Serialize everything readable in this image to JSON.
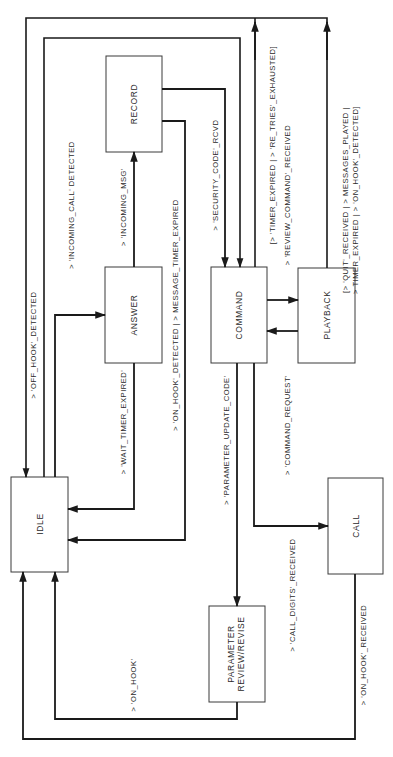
{
  "diagram": {
    "type": "state-transition-diagram",
    "orientation": "rotated-90-ccw",
    "states": [
      {
        "id": "idle",
        "label": "IDLE"
      },
      {
        "id": "answer",
        "label": "ANSWER"
      },
      {
        "id": "record",
        "label": "RECORD"
      },
      {
        "id": "command",
        "label": "COMMAND"
      },
      {
        "id": "playback",
        "label": "PLAYBACK"
      },
      {
        "id": "call",
        "label": "CALL"
      },
      {
        "id": "param",
        "label_line1": "PARAMETER",
        "label_line2": "REVIEW/REVISE"
      }
    ],
    "transitions": [
      {
        "id": "t1",
        "from": "IDLE",
        "to": "ANSWER",
        "label": "> 'INCOMING_CALL' DETECTED"
      },
      {
        "id": "t2",
        "from": "ANSWER",
        "to": "IDLE",
        "label": "> 'WAIT_TIMER_EXPIRED'"
      },
      {
        "id": "t3",
        "from": "ANSWER",
        "to": "RECORD",
        "label": "> 'INCOMING_MSG'"
      },
      {
        "id": "t4",
        "from": "RECORD",
        "to": "IDLE",
        "label": "> 'ON_HOOK'_DETECTED | > MESSAGE_TIMER_EXPIRED"
      },
      {
        "id": "t5",
        "from": "IDLE",
        "to": "COMMAND",
        "label": "> 'OFF_HOOK'_DETECTED"
      },
      {
        "id": "t6",
        "from": "RECORD",
        "to": "COMMAND",
        "label": "> 'SECURITY_CODE'_RCVD"
      },
      {
        "id": "t7",
        "from": "COMMAND",
        "to": "IDLE",
        "label": "[> 'TIMER_EXPIRED | > 'RE_TRIES'_EXHAUSTED]"
      },
      {
        "id": "t8",
        "from": "COMMAND",
        "to": "PLAYBACK",
        "label": "> 'REVIEW_COMMAND'_RECEIVED"
      },
      {
        "id": "t9",
        "from": "PLAYBACK",
        "to": "COMMAND",
        "label": "> 'COMMAND_REQUEST'"
      },
      {
        "id": "t10",
        "from": "PLAYBACK",
        "to": "IDLE",
        "label_line1": "[> 'QUIT'_RECEIVED | > MESSAGES_PLAYED |",
        "label_line2": "> TIMER_EXPIRED | > 'ON_HOOK'_DETECTED]"
      },
      {
        "id": "t11",
        "from": "COMMAND",
        "to": "PARAMETER REVIEW/REVISE",
        "label": "> 'PARAMETER_UPDATE_CODE'"
      },
      {
        "id": "t12",
        "from": "COMMAND",
        "to": "CALL",
        "label": "> 'CALL_DIGITS'_RECEIVED"
      },
      {
        "id": "t13",
        "from": "PARAMETER REVIEW/REVISE",
        "to": "IDLE",
        "label": "> 'ON_HOOK'"
      },
      {
        "id": "t14",
        "from": "CALL",
        "to": "IDLE",
        "label": "> 'ON_HOOK'_RECEIVED"
      }
    ]
  }
}
